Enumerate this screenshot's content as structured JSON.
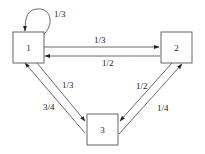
{
  "diagram": {
    "type": "state-transition-graph",
    "colors": {
      "line": "#444444",
      "box_stroke": "#555555",
      "text": "#222222",
      "background": "#ffffff"
    },
    "nodes": [
      {
        "id": "1",
        "label": "1"
      },
      {
        "id": "2",
        "label": "2"
      },
      {
        "id": "3",
        "label": "3"
      }
    ],
    "edges": [
      {
        "from": "1",
        "to": "1",
        "label": "1/3"
      },
      {
        "from": "1",
        "to": "2",
        "label": "1/3"
      },
      {
        "from": "2",
        "to": "1",
        "label": "1/2"
      },
      {
        "from": "1",
        "to": "3",
        "label": "1/3"
      },
      {
        "from": "3",
        "to": "1",
        "label": "3/4"
      },
      {
        "from": "2",
        "to": "3",
        "label": "1/2"
      },
      {
        "from": "3",
        "to": "2",
        "label": "1/4"
      }
    ]
  }
}
